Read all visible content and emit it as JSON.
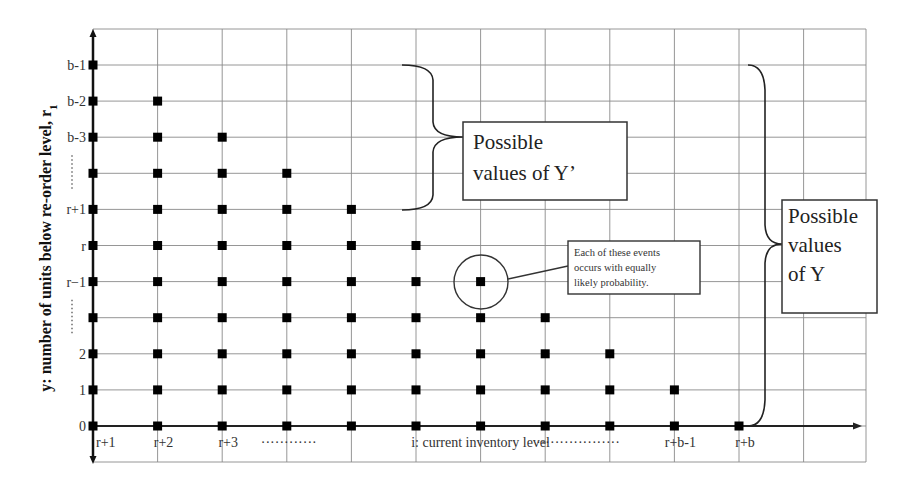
{
  "diagram": {
    "y_axis_title": "y: number of units below re-order level, r",
    "y_axis_title_subscript": "1",
    "y_rows": [
      {
        "label": "0",
        "dots": false
      },
      {
        "label": "1",
        "dots": false
      },
      {
        "label": "2",
        "dots": false
      },
      {
        "label": "",
        "dots": true
      },
      {
        "label": "r−1",
        "dots": false
      },
      {
        "label": "r",
        "dots": false
      },
      {
        "label": "r+1",
        "dots": false
      },
      {
        "label": "",
        "dots": true
      },
      {
        "label": "b-3",
        "dots": false
      },
      {
        "label": "b-2",
        "dots": false
      },
      {
        "label": "b-1",
        "dots": false
      }
    ],
    "x_labels": [
      {
        "col": 0,
        "text": "r+1"
      },
      {
        "col": 1,
        "text": "r+2"
      },
      {
        "col": 2,
        "text": "r+3"
      },
      {
        "col": 3,
        "text": "············",
        "dots": true
      },
      {
        "col": 6,
        "text": "i: current inventory level",
        "center": true
      },
      {
        "col": 9,
        "text": "r+b-1"
      },
      {
        "col": 10,
        "text": "r+b"
      }
    ],
    "x_dots_right": "··················",
    "point_columns_max_row": [
      10,
      9,
      8,
      7,
      6,
      5,
      4,
      3,
      2,
      1,
      0
    ],
    "y_prime_box": {
      "line1": "Possible",
      "line2": "values of Y’"
    },
    "y_box": {
      "line1": "Possible",
      "line2": "values",
      "line3": "of Y"
    },
    "callout": {
      "line1": "Each of these events",
      "line2": "occurs with equally",
      "line3": "likely probability."
    },
    "highlighted_point": {
      "col": 6,
      "row": 4
    }
  }
}
